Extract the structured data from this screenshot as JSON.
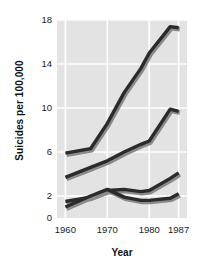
{
  "chart_data": {
    "type": "line",
    "title": "",
    "xlabel": "Year",
    "ylabel": "Suicides per 100,000",
    "xlim": [
      1958,
      1989
    ],
    "ylim": [
      0,
      18
    ],
    "xticks": [
      1960,
      1970,
      1980,
      1987
    ],
    "xtick_labels": [
      "1960",
      "1970",
      "1980",
      "1987"
    ],
    "yticks": [
      0,
      2,
      6,
      10,
      14,
      18
    ],
    "ytick_labels": [
      "0",
      "2",
      "6",
      "10",
      "14",
      "18"
    ],
    "grid": true,
    "grid_color": "#ffffff",
    "plot_background": "#e3e3e3",
    "legend": "none",
    "line_color": "#2b2b2b",
    "series": [
      {
        "name": "series-1",
        "x": [
          1960,
          1966,
          1970,
          1974,
          1978,
          1980,
          1985,
          1987
        ],
        "values": [
          5.9,
          6.3,
          8.6,
          11.4,
          13.6,
          15.0,
          17.4,
          17.3
        ]
      },
      {
        "name": "series-2",
        "x": [
          1960,
          1966,
          1970,
          1974,
          1978,
          1980,
          1985,
          1987
        ],
        "values": [
          3.7,
          4.6,
          5.2,
          6.0,
          6.7,
          7.0,
          9.9,
          9.7
        ]
      },
      {
        "name": "series-3",
        "x": [
          1960,
          1966,
          1970,
          1974,
          1978,
          1980,
          1985,
          1987
        ],
        "values": [
          1.5,
          1.9,
          2.5,
          2.6,
          2.4,
          2.5,
          3.6,
          4.1
        ]
      },
      {
        "name": "series-4",
        "x": [
          1960,
          1966,
          1970,
          1974,
          1978,
          1980,
          1985,
          1987
        ],
        "values": [
          1.0,
          2.0,
          2.6,
          1.9,
          1.6,
          1.6,
          1.8,
          2.2
        ]
      }
    ]
  },
  "axis": {
    "ylabel_text": "Suicides per 100,000",
    "xlabel_text": "Year"
  }
}
